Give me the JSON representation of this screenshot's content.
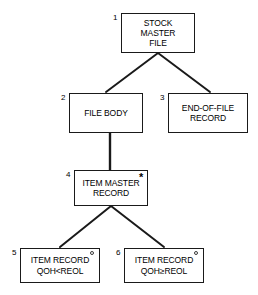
{
  "diagram": {
    "type": "jackson-structure-diagram",
    "background_color": "#ffffff",
    "line_color": "#1a1a1a",
    "text_color": "#000000",
    "nodes": [
      {
        "index": "1",
        "name": "stock-master-file",
        "lines": [
          "STOCK",
          "MASTER",
          "FILE"
        ],
        "marker": "",
        "marker_type": "sequence"
      },
      {
        "index": "2",
        "name": "file-body",
        "lines": [
          "FILE BODY"
        ],
        "marker": "",
        "marker_type": "sequence"
      },
      {
        "index": "3",
        "name": "end-of-file-record",
        "lines": [
          "END-OF-FILE",
          "RECORD"
        ],
        "marker": "",
        "marker_type": "sequence"
      },
      {
        "index": "4",
        "name": "item-master-record",
        "lines": [
          "ITEM MASTER",
          "RECORD"
        ],
        "marker": "*",
        "marker_type": "iteration"
      },
      {
        "index": "5",
        "name": "item-record-below-reorder",
        "lines": [
          "ITEM RECORD",
          "QOH<REOL"
        ],
        "marker": "°",
        "marker_type": "selection"
      },
      {
        "index": "6",
        "name": "item-record-at-or-above-reorder",
        "lines": [
          "ITEM RECORD",
          "QOH≥REOL"
        ],
        "marker": "°",
        "marker_type": "selection"
      }
    ],
    "edges": [
      {
        "from": "1",
        "to": "2",
        "style": "diagonal"
      },
      {
        "from": "1",
        "to": "3",
        "style": "diagonal"
      },
      {
        "from": "2",
        "to": "4",
        "style": "vertical"
      },
      {
        "from": "4",
        "to": "5",
        "style": "diagonal"
      },
      {
        "from": "4",
        "to": "6",
        "style": "diagonal"
      }
    ]
  }
}
